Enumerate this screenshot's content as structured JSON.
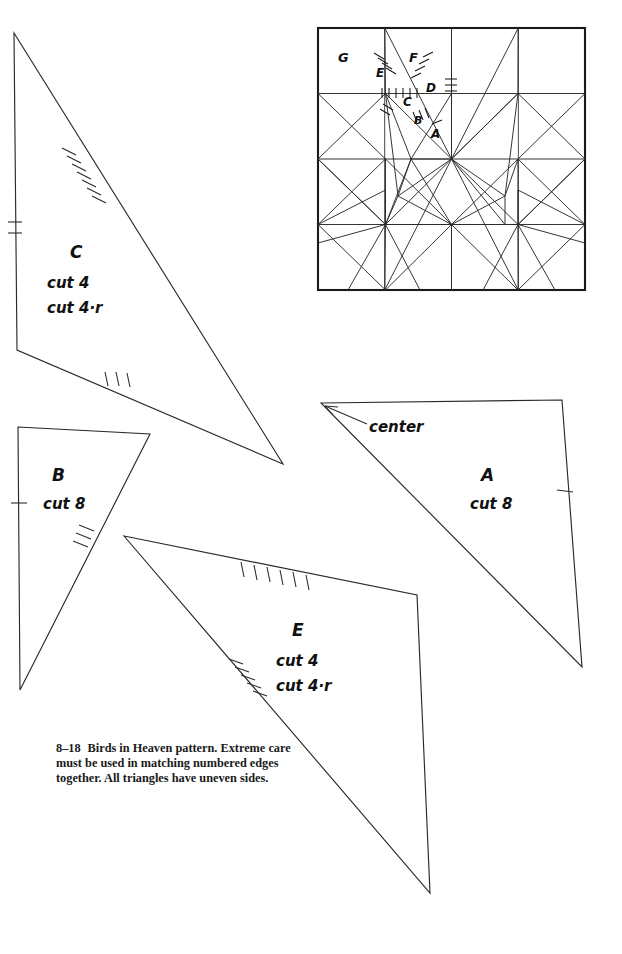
{
  "figure": {
    "number": "8–18",
    "caption_title": "Birds in Heaven pattern.",
    "caption_body": "Extreme care must be used in matching numbered edges together. All triangles have uneven sides."
  },
  "block_diagram": {
    "name": "birds-in-heaven-block",
    "labels": [
      {
        "text": "G",
        "x": 338,
        "y": 62
      },
      {
        "text": "F",
        "x": 409,
        "y": 62
      },
      {
        "text": "E",
        "x": 380,
        "y": 76
      },
      {
        "text": "D",
        "x": 428,
        "y": 89
      },
      {
        "text": "C",
        "x": 407,
        "y": 104
      },
      {
        "text": "B",
        "x": 417,
        "y": 122
      },
      {
        "text": "A",
        "x": 433,
        "y": 135
      }
    ],
    "grid": 4,
    "bounds": {
      "x": 318,
      "y": 28,
      "w": 267,
      "h": 262
    }
  },
  "pieces": [
    {
      "id": "C",
      "name": "piece-c",
      "label": "C",
      "cut_lines": [
        "cut 4",
        "cut 4·r"
      ],
      "label_x": 78,
      "label_y": 256,
      "cut_x": 48,
      "cut_y": 285,
      "cut_line_gap": 25,
      "points": "14,33 283,464 17,350",
      "ticks": [
        {
          "edge": "top-right",
          "count": 8
        },
        {
          "edge": "left",
          "count": 2
        },
        {
          "edge": "bottom",
          "count": 3
        }
      ]
    },
    {
      "id": "B",
      "name": "piece-b",
      "label": "B",
      "cut_lines": [
        "cut 8"
      ],
      "label_x": 60,
      "label_y": 478,
      "cut_x": 45,
      "cut_y": 506,
      "cut_line_gap": 25,
      "points": "18,427 150,434 20,690",
      "ticks": [
        {
          "edge": "left",
          "count": 1
        },
        {
          "edge": "right-diagonal",
          "count": 3
        }
      ]
    },
    {
      "id": "A",
      "name": "piece-a",
      "label": "A",
      "cut_lines": [
        "cut 8"
      ],
      "label_x": 481,
      "label_y": 478,
      "cut_x": 473,
      "cut_y": 506,
      "cut_line_gap": 25,
      "points": "321,403 562,400 582,667",
      "ticks": [
        {
          "edge": "right",
          "count": 1
        }
      ],
      "annotation": {
        "text": "center",
        "x": 369,
        "y": 430,
        "arrow_from": {
          "x": 365,
          "y": 423
        },
        "arrow_to": {
          "x": 324,
          "y": 405
        }
      }
    },
    {
      "id": "E",
      "name": "piece-e",
      "label": "E",
      "cut_lines": [
        "cut 4",
        "cut 4·r"
      ],
      "label_x": 296,
      "label_y": 633,
      "cut_x": 278,
      "cut_y": 663,
      "cut_line_gap": 25,
      "points": "124,536 417,595 430,893",
      "ticks": [
        {
          "edge": "top",
          "count": 7
        },
        {
          "edge": "left-diagonal",
          "count": 5
        }
      ]
    }
  ],
  "colors": {
    "ink": "#1a1a1a",
    "paper": "#ffffff",
    "line": "#2b2b2b"
  }
}
